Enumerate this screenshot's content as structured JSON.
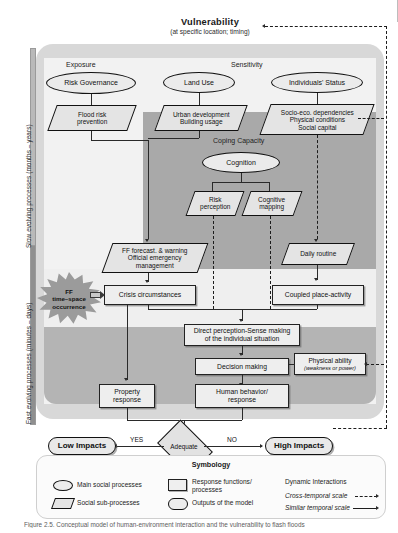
{
  "title": {
    "main": "Vulnerability",
    "sub": "(at specific location; timing)"
  },
  "temporal_axis": {
    "slow": "Slow evolving processes (months – years)",
    "fast": "Fast evolving processes (minutes – days)"
  },
  "sections": {
    "exposure": "Exposure",
    "sensitivity": "Sensitivity",
    "coping_capacity": "Coping Capacity"
  },
  "nodes": {
    "risk_governance": "Risk Governance",
    "flood_risk_prevention": "Flood risk\nprevention",
    "land_use": "Land Use",
    "urban_development": "Urban development\nBuilding usage",
    "individuals_status": "Individuals' Status",
    "socio_eco": "Socio-eco. dependencies\nPhysical conditions\nSocial capital",
    "cognition": "Cognition",
    "risk_perception": "Risk\nperception",
    "cognitive_mapping": "Cognitive\nmapping",
    "ff_forecast": "FF forecast. & warning\nOfficial emergency\nmanagement",
    "daily_routine": "Daily routine",
    "crisis_circumstances": "Crisis circumstances",
    "coupled_place_activity": "Coupled place-activity",
    "direct_perception": "Direct perception-Sense making\nof the individual situation",
    "decision_making": "Decision making",
    "physical_ability": "Physical ability",
    "physical_ability_sub": "(weakness or power)",
    "property_response": "Property\nresponse",
    "human_behavior": "Human behavior/\nresponse",
    "adequate": "Adequate",
    "low_impacts": "Low Impacts",
    "high_impacts": "High Impacts",
    "ff_occurrence": "FF\ntime–space\noccurrence"
  },
  "edge_labels": {
    "yes": "YES",
    "no": "NO"
  },
  "legend": {
    "title": "Symbology",
    "items": [
      {
        "shape": "ellipse",
        "label": "Main social processes"
      },
      {
        "shape": "parallelogram",
        "label": "Social sub-processes"
      },
      {
        "shape": "rectangle",
        "label": "Response functions/\nprocesses"
      },
      {
        "shape": "rounded",
        "label": "Outputs of the model"
      }
    ],
    "interactions_title": "Dynamic Interactions",
    "cross_temporal": "Cross-temporal scale",
    "similar_temporal": "Similar temporal scale"
  },
  "caption": "Figure 2.5. Conceptual model of human-environment interaction and the vulnerability to flash floods",
  "colors": {
    "panel": "#d8d8d8",
    "light_band": "#f2f2f2",
    "coping_band": "#a9a9a9",
    "fast_band": "#b4b4b4",
    "ellipse_fill": "#ebebeb",
    "parallelogram_fill": "#e4e4e4",
    "rect_fill": "#eeeeee",
    "line": "#2a2a2a"
  }
}
